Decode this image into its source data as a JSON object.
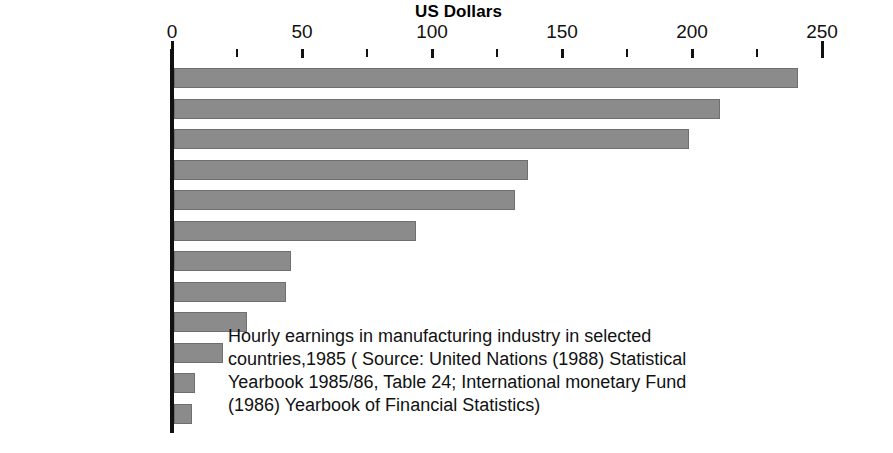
{
  "chart_data": {
    "type": "bar",
    "orientation": "horizontal",
    "title": "US Dollars",
    "xlabel": "US Dollars",
    "ylabel": "",
    "xlim": [
      0,
      250
    ],
    "xticks": [
      0,
      50,
      100,
      150,
      200,
      250
    ],
    "xtick_labels": [
      "0",
      "50",
      "100",
      "150",
      "200",
      "250"
    ],
    "minor_tick_interval": 25,
    "grid": false,
    "legend": null,
    "categories": [
      "United States",
      "Canada",
      "Japan",
      "United Kingdom",
      "Ireland",
      "Spain",
      "Singapore",
      "South Korea",
      "Portugal",
      "Kenya",
      "Sri Lanka",
      "Bangladesh"
    ],
    "values": [
      240,
      210,
      198,
      136,
      131,
      93,
      45,
      43,
      28,
      19,
      8,
      7
    ],
    "bar_color": "#8b8b8b",
    "bar_border_color": "#6f6f6f",
    "caption_lines": [
      "Hourly earnings in manufacturing industry in selected",
      "countries,1985 ( Source: United Nations (1988) Statistical",
      "Yearbook 1985/86, Table 24; International monetary Fund",
      "(1986) Yearbook of Financial Statistics)"
    ]
  },
  "axis": {
    "title": "US Dollars",
    "ticks": [
      {
        "value": 0,
        "label": "0",
        "major": true
      },
      {
        "value": 25,
        "label": "",
        "major": false
      },
      {
        "value": 50,
        "label": "50",
        "major": true
      },
      {
        "value": 75,
        "label": "",
        "major": false
      },
      {
        "value": 100,
        "label": "100",
        "major": true
      },
      {
        "value": 125,
        "label": "",
        "major": false
      },
      {
        "value": 150,
        "label": "150",
        "major": true
      },
      {
        "value": 175,
        "label": "",
        "major": false
      },
      {
        "value": 200,
        "label": "200",
        "major": true
      },
      {
        "value": 225,
        "label": "",
        "major": false
      },
      {
        "value": 250,
        "label": "250",
        "major": true
      }
    ]
  },
  "caption": {
    "line1": "Hourly earnings in manufacturing industry in selected",
    "line2": "countries,1985 ( Source: United Nations (1988) Statistical",
    "line3": "Yearbook 1985/86, Table 24; International monetary Fund",
    "line4": "(1986) Yearbook of Financial Statistics)"
  }
}
